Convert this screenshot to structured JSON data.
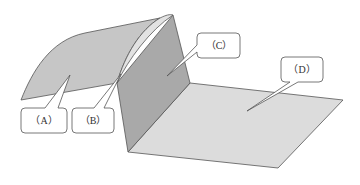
{
  "diagram": {
    "type": "sheet-metal surface regions",
    "colors": {
      "background": "#ffffff",
      "curved_face": "#c8c8c8",
      "fillet_face": "#dedede",
      "wall_face": "#a8a8a8",
      "floor_face": "#dcdcdc",
      "edge": "#555555",
      "callout_border": "#555555"
    },
    "callouts": [
      {
        "id": "A",
        "label": "（A）",
        "target": "curved-face"
      },
      {
        "id": "B",
        "label": "（B）",
        "target": "fillet-face"
      },
      {
        "id": "C",
        "label": "（C）",
        "target": "wall-face"
      },
      {
        "id": "D",
        "label": "（D）",
        "target": "floor-face"
      }
    ]
  }
}
